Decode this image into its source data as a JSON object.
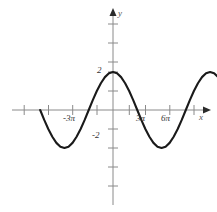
{
  "figure": {
    "background_color": "#ffffff",
    "curve_color": "#1a1a1a",
    "axis_color": "#8a8a8a"
  },
  "axes": {
    "x_axis_name": "x",
    "y_axis_name": "y",
    "x_tick_labels": [
      "-3π",
      "3π",
      "6π"
    ],
    "y_tick_labels": [
      "2",
      "-2"
    ],
    "label_neg_3pi": "-3π",
    "label_3pi": "3π",
    "label_6pi": "6π",
    "label_2": "2",
    "label_neg_2": "-2"
  },
  "chart_data": {
    "type": "line",
    "title": "",
    "xlabel": "x",
    "ylabel": "y",
    "function": "y = 2 cos(x/3)",
    "amplitude": 2,
    "period": "6π",
    "grid": false,
    "legend": false,
    "xlim": [
      -14.137,
      20.42
    ],
    "ylim": [
      -3.2,
      4.8
    ],
    "xlim_pi_units": [
      -4.5,
      6.5
    ],
    "x_ticks_pi_units": [
      -4.5,
      -3.0,
      -1.5,
      0,
      1.5,
      3.0,
      4.5,
      6.0,
      7.5
    ],
    "x_labeled_ticks": [
      {
        "value_pi_units": -3,
        "label": "-3π"
      },
      {
        "value_pi_units": 3,
        "label": "3π"
      },
      {
        "value_pi_units": 6,
        "label": "6π"
      }
    ],
    "y_ticks": [
      -3,
      -2,
      -1,
      0,
      1,
      2,
      3,
      4
    ],
    "y_labeled_ticks": [
      {
        "value": 2,
        "label": "2"
      },
      {
        "value": -2,
        "label": "-2"
      }
    ],
    "series": [
      {
        "name": "y = 2 cos(x/3)",
        "x_pi_units": [
          -4.5,
          -4.25,
          -4.0,
          -3.75,
          -3.5,
          -3.25,
          -3.0,
          -2.75,
          -2.5,
          -2.25,
          -2.0,
          -1.75,
          -1.5,
          -1.25,
          -1.0,
          -0.75,
          -0.5,
          -0.25,
          0.0,
          0.25,
          0.5,
          0.75,
          1.0,
          1.25,
          1.5,
          1.75,
          2.0,
          2.25,
          2.5,
          2.75,
          3.0,
          3.25,
          3.5,
          3.75,
          4.0,
          4.25,
          4.5,
          4.75,
          5.0,
          5.25,
          5.5,
          5.75,
          6.0,
          6.25,
          6.5
        ],
        "y": [
          0.0,
          -0.52,
          -1.0,
          -1.41,
          -1.73,
          -1.93,
          -2.0,
          -1.93,
          -1.73,
          -1.41,
          -1.0,
          -0.52,
          0.0,
          0.52,
          1.0,
          1.41,
          1.73,
          1.93,
          2.0,
          1.93,
          1.73,
          1.41,
          1.0,
          0.52,
          0.0,
          -0.52,
          -1.0,
          -1.41,
          -1.73,
          -1.93,
          -2.0,
          -1.93,
          -1.73,
          -1.41,
          -1.0,
          -0.52,
          0.0,
          0.52,
          1.0,
          1.41,
          1.73,
          1.93,
          2.0,
          1.93,
          1.73
        ]
      }
    ],
    "annotations": [
      {
        "text": "2",
        "note": "y-axis value label at local maximum"
      },
      {
        "text": "-2",
        "note": "y-axis value label at local minimum"
      }
    ]
  }
}
